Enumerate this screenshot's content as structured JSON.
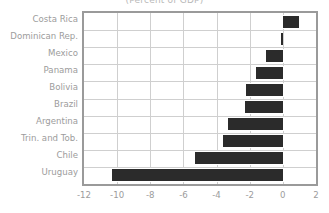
{
  "chart_data": {
    "type": "bar",
    "orientation": "horizontal",
    "title": "(Percent of GDP)",
    "xlabel": "",
    "ylabel": "",
    "categories": [
      "Costa Rica",
      "Dominican Rep.",
      "Mexico",
      "Panama",
      "Bolivia",
      "Brazil",
      "Argentina",
      "Trin. and Tob.",
      "Chile",
      "Uruguay"
    ],
    "values": [
      1.0,
      -0.1,
      -1.0,
      -1.6,
      -2.2,
      -2.3,
      -3.3,
      -3.6,
      -5.3,
      -10.3
    ],
    "xlim": [
      -12,
      2
    ],
    "xticks": [
      -12,
      -10,
      -8,
      -6,
      -4,
      -2,
      0,
      2
    ],
    "xtick_labels": [
      "-12",
      "-10",
      "-8",
      "-6",
      "-4",
      "-2",
      "0",
      "2"
    ],
    "grid": true,
    "grid_axis": "both",
    "legend": false,
    "bar_color": "#2b2b2b",
    "frame_color": "#9a9a9a",
    "grid_color": "#cfcfcf",
    "label_color": "#9c9c9c"
  }
}
